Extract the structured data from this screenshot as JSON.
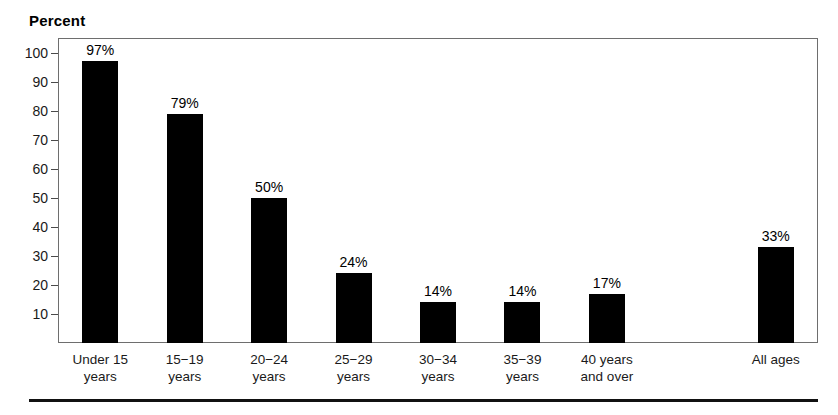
{
  "chart_data": {
    "type": "bar",
    "title": "",
    "ylabel": "Percent",
    "xlabel": "",
    "ylim": [
      0,
      105
    ],
    "grid": false,
    "legend": null,
    "bar_color": "#000000",
    "frame_color": "#6e6e6e",
    "categories": [
      "Under 15 years",
      "15−19 years",
      "20−24 years",
      "25−29 years",
      "30−34 years",
      "35−39 years",
      "40 years and over",
      "All ages"
    ],
    "values": [
      97,
      79,
      50,
      24,
      14,
      14,
      17,
      33
    ],
    "value_labels": [
      "97%",
      "79%",
      "50%",
      "24%",
      "14%",
      "14%",
      "17%",
      "33%"
    ],
    "ytick_values": [
      10,
      20,
      30,
      40,
      50,
      60,
      70,
      80,
      90,
      100
    ],
    "ytick_labels": [
      "10",
      "20",
      "30",
      "40",
      "50",
      "60",
      "70",
      "80",
      "90",
      "100"
    ],
    "category_lines": [
      [
        "Under 15",
        "years"
      ],
      [
        "15−19",
        "years"
      ],
      [
        "20−24",
        "years"
      ],
      [
        "25−29",
        "years"
      ],
      [
        "30−34",
        "years"
      ],
      [
        "35−39",
        "years"
      ],
      [
        "40 years",
        "and over"
      ],
      [
        "All ages",
        ""
      ]
    ],
    "slot_index": [
      0,
      1,
      2,
      3,
      4,
      5,
      6,
      8
    ],
    "slot_count": 9
  }
}
